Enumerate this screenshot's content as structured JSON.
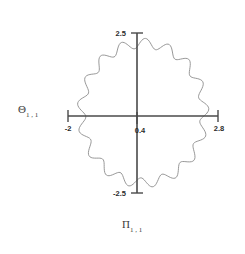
{
  "figure": {
    "background_color": "#ffffff",
    "axis_color": "#4a4a4a",
    "curve_color": "#8c8c8c",
    "text_color": "#3a3a3a",
    "tick_text_color": "#2b2b2b"
  },
  "axis_labels": {
    "y_axis": {
      "symbol": "Θ",
      "subscript": "1 , 1"
    },
    "x_axis": {
      "symbol": "Π",
      "subscript": "1 , 1"
    }
  },
  "ticks": {
    "x": [
      {
        "label": "-2",
        "value": -2
      },
      {
        "label": "0.4",
        "value": 0.4
      },
      {
        "label": "2.8",
        "value": 2.8
      }
    ],
    "y": [
      {
        "label": "2.5",
        "value": 2.5
      },
      {
        "label": "-2.5",
        "value": -2.5
      }
    ]
  },
  "chart_data": {
    "type": "line",
    "title": "",
    "xlabel": "Π 1 , 1",
    "ylabel": "Θ 1 , 1",
    "xlim": [
      -2,
      2.8
    ],
    "ylim": [
      -2.5,
      2.5
    ],
    "xticks": [
      -2,
      0.4,
      2.8
    ],
    "yticks": [
      -2.5,
      2.5
    ],
    "xticklabels": [
      "-2",
      "0.4",
      "2.8"
    ],
    "yticklabels": [
      "-2.5",
      "2.5"
    ],
    "grid": false,
    "legend": false,
    "series": [
      {
        "name": "orbit",
        "closed": true,
        "color": "#8c8c8c",
        "center": [
          0.4,
          0.0
        ],
        "base_radius_x": 1.97,
        "base_radius_y": 2.18,
        "ripple_count": 17,
        "ripple_amplitude": 0.07,
        "x": [
          2.37,
          2.35,
          2.3,
          2.26,
          2.17,
          2.07,
          1.97,
          1.82,
          1.66,
          1.49,
          1.3,
          1.1,
          0.89,
          0.68,
          0.46,
          0.25,
          0.03,
          -0.18,
          -0.39,
          -0.59,
          -0.79,
          -0.97,
          -1.14,
          -1.3,
          -1.43,
          -1.54,
          -1.62,
          -1.57,
          -1.53,
          -1.5,
          -1.49,
          -1.52,
          -1.56,
          -1.6,
          -1.53,
          -1.43,
          -1.29,
          -1.13,
          -0.95,
          -0.75,
          -0.54,
          -0.32,
          -0.1,
          0.12,
          0.34,
          0.56,
          0.77,
          0.98,
          1.18,
          1.37,
          1.55,
          1.72,
          1.87,
          2.0,
          2.11,
          2.2,
          2.27,
          2.32,
          2.36,
          2.37
        ],
        "y": [
          0.12,
          0.43,
          0.73,
          1.02,
          1.28,
          1.48,
          1.65,
          1.8,
          1.93,
          2.02,
          2.1,
          2.16,
          2.19,
          2.2,
          2.18,
          2.17,
          2.14,
          2.08,
          2.0,
          1.92,
          1.82,
          1.7,
          1.56,
          1.39,
          1.2,
          0.99,
          0.77,
          0.53,
          0.3,
          0.06,
          -0.18,
          -0.42,
          -0.66,
          -0.9,
          -1.12,
          -1.33,
          -1.52,
          -1.69,
          -1.84,
          -1.96,
          -2.05,
          -2.12,
          -2.16,
          -2.18,
          -2.19,
          -2.17,
          -2.13,
          -2.07,
          -1.99,
          -1.89,
          -1.77,
          -1.63,
          -1.47,
          -1.29,
          -1.08,
          -0.85,
          -0.6,
          -0.34,
          -0.08,
          0.12
        ]
      }
    ]
  }
}
